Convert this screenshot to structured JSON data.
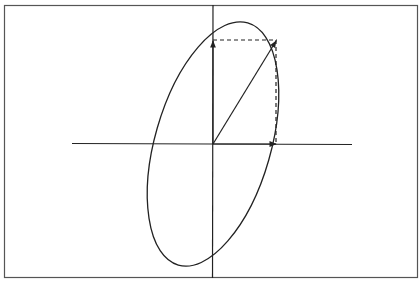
{
  "diagram": {
    "frame": {
      "x": 4,
      "y": 5,
      "width": 414,
      "height": 273
    },
    "origin": {
      "x": 213,
      "y": 144
    },
    "axes": {
      "horizontal": {
        "x1": 72,
        "x2": 352,
        "y": 143
      },
      "vertical": {
        "x": 213,
        "y1": 5,
        "y2": 278
      }
    },
    "ellipse": {
      "cx": 213,
      "cy": 144,
      "rx": 58,
      "ry": 126,
      "rotation_deg": 16
    },
    "vectors": [
      {
        "name": "resultant",
        "x2": 277,
        "y2": 40
      },
      {
        "name": "x-component",
        "x2": 277,
        "y2": 144
      },
      {
        "name": "y-component",
        "x2": 213,
        "y2": 40
      }
    ],
    "dashed_projection": {
      "corner": {
        "x": 277,
        "y": 40
      }
    },
    "colors": {
      "stroke": "#222222",
      "frame": "#555555",
      "background": "#ffffff"
    }
  }
}
